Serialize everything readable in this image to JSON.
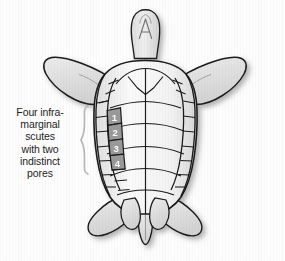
{
  "figure": {
    "top_cropped_text": "",
    "background_color": "#fdfdfd",
    "outline_color": "#1a1a1a",
    "body_fill_light": "#eeeeee",
    "body_fill_mid": "#d8d8d8",
    "highlight_scute_color": "#9a9a9a",
    "number_text_color": "#ffffff",
    "bracket_color": "#b9b9b9",
    "label_text_color": "#1d1d1d"
  },
  "callout": {
    "lines": [
      "Four infra-",
      "marginal",
      "scutes",
      "with two",
      "indistinct",
      "pores"
    ],
    "full_text": "Four infra-marginal scutes with two indistinct pores"
  },
  "scutes": {
    "labels": [
      "1",
      "2",
      "3",
      "4"
    ],
    "count": 4,
    "side": "left",
    "highlighted": true
  },
  "anatomy": {
    "parts": [
      "head",
      "left-front-flipper",
      "right-front-flipper",
      "plastron",
      "left-inframarginal-scutes",
      "right-inframarginal-scutes",
      "left-rear-flipper",
      "right-rear-flipper",
      "tail"
    ]
  }
}
